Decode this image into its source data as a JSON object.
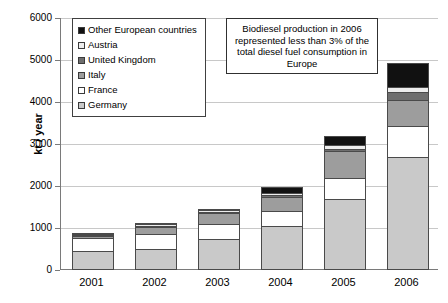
{
  "chart_data": {
    "type": "bar",
    "stacked": true,
    "title": "",
    "xlabel": "",
    "ylabel": "kt / year",
    "ylim": [
      0,
      6000
    ],
    "ytick_step": 1000,
    "grid": true,
    "legend_position": "upper-left-inside",
    "categories": [
      "2001",
      "2002",
      "2003",
      "2004",
      "2005",
      "2006"
    ],
    "ytick_labels": [
      "0",
      "1000",
      "2000",
      "3000",
      "4000",
      "5000",
      "6000"
    ],
    "series": [
      {
        "name": "Germany",
        "values": [
          450,
          500,
          730,
          1050,
          1700,
          2700
        ]
      },
      {
        "name": "France",
        "values": [
          320,
          350,
          360,
          360,
          490,
          740
        ]
      },
      {
        "name": "Italy",
        "values": [
          20,
          180,
          270,
          330,
          640,
          600
        ]
      },
      {
        "name": "United Kingdom",
        "values": [
          5,
          15,
          20,
          35,
          60,
          200
        ]
      },
      {
        "name": "Austria",
        "values": [
          20,
          25,
          35,
          60,
          85,
          110
        ]
      },
      {
        "name": "Other European countries",
        "values": [
          5,
          20,
          35,
          135,
          215,
          570
        ]
      }
    ],
    "totals": [
      820,
      1090,
      1450,
      1970,
      3190,
      4920
    ],
    "annotation": "Biodiesel production in 2006 represented less than 3% of the total diesel fuel consumption in Europe"
  },
  "legend": {
    "items": [
      {
        "label": "Other European countries",
        "color": "#111111"
      },
      {
        "label": "Austria",
        "color": "#ededed"
      },
      {
        "label": "United Kingdom",
        "color": "#6e6e6e"
      },
      {
        "label": "Italy",
        "color": "#9d9d9d"
      },
      {
        "label": "France",
        "color": "#ffffff"
      },
      {
        "label": "Germany",
        "color": "#c9c9c9"
      }
    ]
  },
  "colors": {
    "germany": "#c9c9c9",
    "france": "#ffffff",
    "italy": "#9d9d9d",
    "united_kingdom": "#6e6e6e",
    "austria": "#ededed",
    "other": "#111111",
    "grid": "#c8c8c8",
    "axis": "#7a7a7a",
    "outline": "#4a4a4a"
  }
}
